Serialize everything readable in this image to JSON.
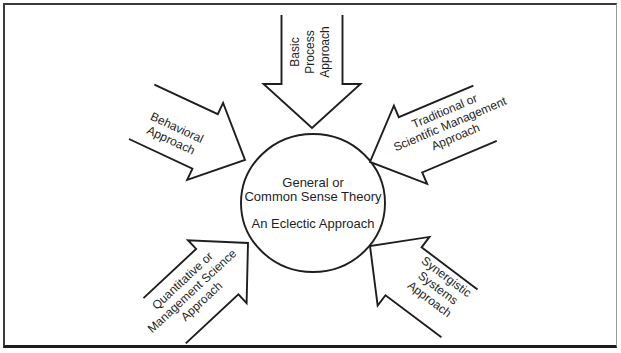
{
  "diagram": {
    "center_circle": {
      "line1": "General or",
      "line2": "Common Sense Theory",
      "line3": "An Eclectic Approach"
    },
    "arrow_labels": {
      "basic_process": {
        "line1": "Basic",
        "line2": "Process",
        "line3": "Approach"
      },
      "behavioral": {
        "line1": "Behavioral",
        "line2": "Approach"
      },
      "traditional_scientific": {
        "line1": "Traditional or",
        "line2": "Scientific Management",
        "line3": "Approach"
      },
      "quantitative_management_science": {
        "line1": "Quantitative or",
        "line2": "Management Science",
        "line3": "Approach"
      },
      "synergistic_systems": {
        "line1": "Synergistic",
        "line2": "Systems",
        "line3": "Approach"
      }
    },
    "colors": {
      "ink": "#1e1e1e",
      "background": "#ffffff",
      "frame_border": "#3a3a3a"
    }
  }
}
